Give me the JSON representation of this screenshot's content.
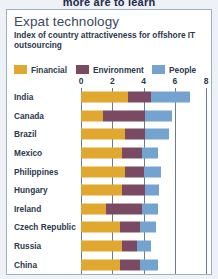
{
  "clipped_headline": "more are to learn",
  "card": {
    "title": "Expat technology",
    "subtitle": "Index of country attractiveness for offshore IT outsourcing"
  },
  "colors": {
    "financial": "#E0A82E",
    "environment": "#7A4A63",
    "people": "#74A3D0",
    "axis": "#6B7A8D",
    "text": "#2B3A4D",
    "title": "#3A4A5E",
    "card_border": "#9FB0C6",
    "page_background": "#EEF1F5"
  },
  "chart_data": {
    "type": "bar",
    "orientation": "horizontal",
    "stacked": true,
    "title": "Expat technology",
    "subtitle": "Index of country attractiveness for offshore IT outsourcing",
    "xlabel": "",
    "ylabel": "",
    "xlim": [
      0,
      8
    ],
    "xticks": [
      0,
      2,
      4,
      6,
      8
    ],
    "xtick_labels": [
      "0",
      "2",
      "4",
      "6",
      "8"
    ],
    "grid": true,
    "legend_position": "top",
    "categories": [
      "India",
      "Canada",
      "Brazil",
      "Mexico",
      "Philippines",
      "Hungary",
      "Ireland",
      "Czech Republic",
      "Russia",
      "China"
    ],
    "series": [
      {
        "name": "Financial",
        "color": "#E0A82E",
        "values": [
          3.0,
          1.4,
          2.8,
          2.6,
          2.8,
          2.6,
          1.6,
          2.5,
          2.6,
          2.5
        ]
      },
      {
        "name": "Environment",
        "color": "#7A4A63",
        "values": [
          1.5,
          2.7,
          1.3,
          1.3,
          1.2,
          1.5,
          2.3,
          1.3,
          1.0,
          1.3
        ]
      },
      {
        "name": "People",
        "color": "#74A3D0",
        "values": [
          2.5,
          1.7,
          1.5,
          1.0,
          1.1,
          0.9,
          1.0,
          1.0,
          0.9,
          1.1
        ]
      }
    ],
    "totals": [
      7.0,
      5.8,
      5.6,
      4.9,
      5.1,
      5.0,
      4.9,
      4.8,
      4.5,
      4.9
    ]
  }
}
